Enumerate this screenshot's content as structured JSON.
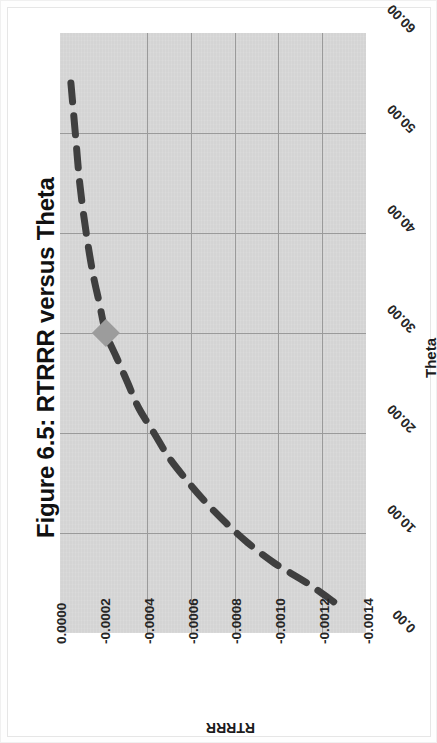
{
  "figure": {
    "title": "Figure 6.5: RTRRR versus Theta",
    "background_color": "#ffffff",
    "plot_background_color": "#d4d4d4",
    "gridline_color": "#9a9a9a",
    "series_color": "#3f3f3f",
    "marker_color": "#9c9c9c",
    "rotation_note": "chart rendered rotated 90 degrees clockwise in page"
  },
  "axes": {
    "x_title": "Theta",
    "y_title": "RTRRR",
    "x_ticks": [
      "0.00",
      "10.00",
      "20.00",
      "30.00",
      "40.00",
      "50.00",
      "60.00"
    ],
    "y_ticks": [
      "0.0000",
      "-0.0002",
      "-0.0004",
      "-0.0006",
      "-0.0008",
      "-0.0010",
      "-0.0012",
      "-0.0014"
    ]
  },
  "chart_data": {
    "type": "line",
    "title": "Figure 6.5: RTRRR versus Theta",
    "xlabel": "Theta",
    "ylabel": "RTRRR",
    "xlim": [
      0,
      60
    ],
    "ylim": [
      -0.0014,
      0.0
    ],
    "xticks": [
      0,
      10,
      20,
      30,
      40,
      50,
      60
    ],
    "yticks": [
      0.0,
      -0.0002,
      -0.0004,
      -0.0006,
      -0.0008,
      -0.001,
      -0.0012,
      -0.0014
    ],
    "grid": true,
    "legend": "none",
    "linestyle": "dashed",
    "series": [
      {
        "name": "RTRRR",
        "x": [
          3.0,
          5.0,
          7.0,
          9.0,
          11.0,
          13.0,
          15.0,
          17.5,
          20.0,
          22.5,
          25.0,
          27.5,
          30.0,
          33.0,
          36.0,
          40.0,
          45.0,
          50.0,
          55.0
        ],
        "y": [
          -0.00126,
          -0.00113,
          -0.00098,
          -0.00086,
          -0.00076,
          -0.00067,
          -0.00059,
          -0.0005,
          -0.00043,
          -0.00036,
          -0.00031,
          -0.00026,
          -0.00021,
          -0.00018,
          -0.00015,
          -0.00012,
          -9e-05,
          -7e-05,
          -5e-05
        ]
      }
    ],
    "markers": [
      {
        "label": "selected-point",
        "x": 30.0,
        "y": -0.00021,
        "shape": "diamond",
        "color": "#9c9c9c"
      }
    ]
  }
}
